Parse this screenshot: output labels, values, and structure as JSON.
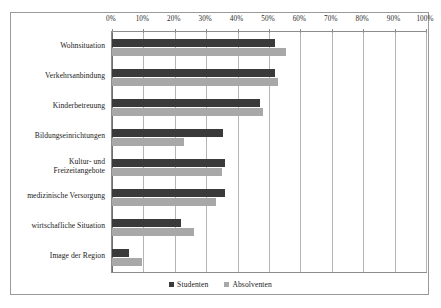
{
  "chart_data": {
    "type": "bar",
    "orientation": "horizontal",
    "title": "",
    "subtitle": "",
    "xlabel": "",
    "ylabel": "",
    "xlim": [
      0,
      100
    ],
    "xtick_labels": [
      "0%",
      "10%",
      "20%",
      "30%",
      "40%",
      "50%",
      "60%",
      "70%",
      "80%",
      "90%",
      "100%"
    ],
    "xtick_values": [
      0,
      10,
      20,
      30,
      40,
      50,
      60,
      70,
      80,
      90,
      100
    ],
    "grid": true,
    "legend_position": "bottom",
    "categories": [
      "Wohnsituation",
      "Verkehrsanbindung",
      "Kinderbetreuung",
      "Bildungseinrichtungen",
      "Kultur- und\nFreizeitangebote",
      "medizinische Versorgung",
      "wirtschafliche Situation",
      "Image der Region"
    ],
    "series": [
      {
        "name": "Studenten",
        "color": "#3a3a3a",
        "values": [
          52,
          52,
          47,
          35.5,
          36,
          36,
          22,
          5.5
        ]
      },
      {
        "name": "Absolventen",
        "color": "#a8a8a8",
        "values": [
          55.5,
          53,
          48,
          23,
          35,
          33,
          26,
          9.5
        ]
      }
    ]
  },
  "legend": {
    "entries": [
      {
        "label": "Studenten",
        "color": "#3a3a3a"
      },
      {
        "label": "Absolventen",
        "color": "#a8a8a8"
      }
    ]
  }
}
